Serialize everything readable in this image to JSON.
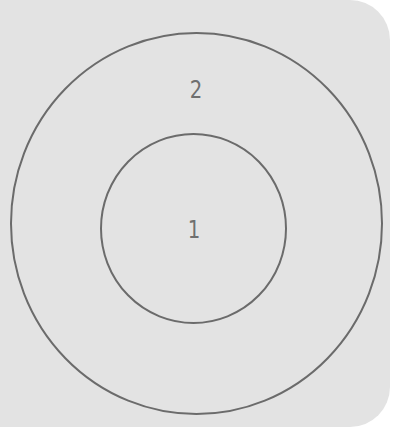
{
  "diagram": {
    "type": "concentric-zones",
    "colors": {
      "background": "#e3e3e3",
      "stroke": "#6b6b6b",
      "label": "#6f6f6f"
    },
    "zones": [
      {
        "id": "inner",
        "label": "1"
      },
      {
        "id": "outer",
        "label": "2"
      }
    ]
  }
}
